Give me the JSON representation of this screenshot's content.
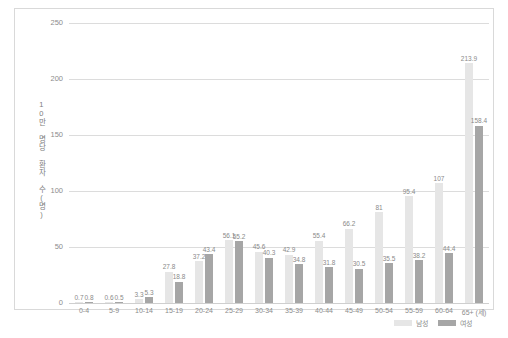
{
  "chart_data": {
    "type": "bar",
    "title": "",
    "xlabel": "",
    "ylabel": "10만 명당 환자 수(명)",
    "ylim": [
      0,
      250
    ],
    "yticks": [
      0,
      50,
      100,
      150,
      200,
      250
    ],
    "grid": true,
    "legend_position": "bottom-right",
    "categories": [
      "0-4",
      "5-9",
      "10-14",
      "15-19",
      "20-24",
      "25-29",
      "30-34",
      "35-39",
      "40-44",
      "45-49",
      "50-54",
      "55-59",
      "60-64",
      "65+ (세)"
    ],
    "series": [
      {
        "name": "남성",
        "color": "#e6e6e6",
        "values": [
          0.7,
          0.6,
          3.3,
          27.8,
          37.2,
          56.1,
          45.6,
          42.9,
          55.4,
          66.2,
          81,
          95.4,
          107,
          213.9
        ]
      },
      {
        "name": "여성",
        "color": "#a6a6a6",
        "values": [
          0.8,
          0.5,
          5.3,
          18.8,
          43.4,
          55.2,
          40.3,
          34.8,
          31.8,
          30.5,
          35.5,
          38.2,
          44.4,
          158.4
        ]
      }
    ]
  },
  "legend": {
    "items": [
      {
        "label": "남성",
        "color": "#e6e6e6"
      },
      {
        "label": "여성",
        "color": "#a6a6a6"
      }
    ]
  }
}
